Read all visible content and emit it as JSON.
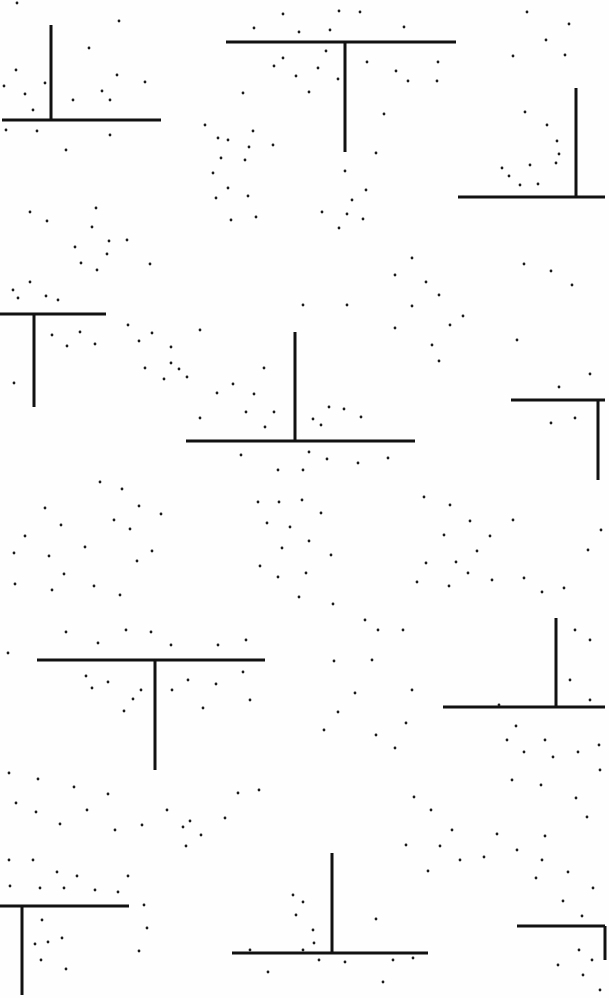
{
  "pattern": {
    "width": 609,
    "height": 998,
    "background": "#fefefe",
    "ink": "#111111",
    "t_shapes": [
      {
        "hx1": 2,
        "hx2": 161,
        "hy": 120,
        "vx": 51,
        "vy1": 25,
        "vy2": 120
      },
      {
        "hx1": 226,
        "hx2": 456,
        "hy": 42,
        "vx": 345,
        "vy1": 42,
        "vy2": 152
      },
      {
        "hx1": 458,
        "hx2": 605,
        "hy": 197,
        "vx": 576,
        "vy1": 88,
        "vy2": 197
      },
      {
        "hx1": 0,
        "hx2": 106,
        "hy": 314,
        "vx": 34,
        "vy1": 314,
        "vy2": 407
      },
      {
        "hx1": 186,
        "hx2": 415,
        "hy": 441,
        "vx": 295,
        "vy1": 332,
        "vy2": 441
      },
      {
        "hx1": 511,
        "hx2": 605,
        "hy": 400,
        "vx": 598,
        "vy1": 400,
        "vy2": 480
      },
      {
        "hx1": 37,
        "hx2": 265,
        "hy": 660,
        "vx": 155,
        "vy1": 660,
        "vy2": 770
      },
      {
        "hx1": 443,
        "hx2": 605,
        "hy": 707,
        "vx": 556,
        "vy1": 618,
        "vy2": 707
      },
      {
        "hx1": 0,
        "hx2": 129,
        "hy": 906,
        "vx": 22,
        "vy1": 906,
        "vy2": 995
      },
      {
        "hx1": 232,
        "hx2": 428,
        "hy": 953,
        "vx": 332,
        "vy1": 853,
        "vy2": 953
      },
      {
        "hx1": 517,
        "hx2": 605,
        "hy": 926,
        "vx": 605,
        "vy1": 926,
        "vy2": 960
      }
    ],
    "dots": [
      [
        17,
        3
      ],
      [
        119,
        21
      ],
      [
        89,
        48
      ],
      [
        16,
        70
      ],
      [
        45,
        83
      ],
      [
        25,
        94
      ],
      [
        102,
        91
      ],
      [
        73,
        100
      ],
      [
        145,
        82
      ],
      [
        117,
        75
      ],
      [
        110,
        100
      ],
      [
        33,
        110
      ],
      [
        6,
        130
      ],
      [
        37,
        131
      ],
      [
        66,
        150
      ],
      [
        110,
        135
      ],
      [
        4,
        86
      ],
      [
        283,
        14
      ],
      [
        339,
        11
      ],
      [
        360,
        12
      ],
      [
        254,
        28
      ],
      [
        299,
        32
      ],
      [
        330,
        30
      ],
      [
        404,
        27
      ],
      [
        326,
        51
      ],
      [
        283,
        58
      ],
      [
        274,
        66
      ],
      [
        296,
        76
      ],
      [
        318,
        68
      ],
      [
        338,
        79
      ],
      [
        367,
        62
      ],
      [
        396,
        71
      ],
      [
        408,
        81
      ],
      [
        438,
        62
      ],
      [
        437,
        81
      ],
      [
        309,
        92
      ],
      [
        384,
        114
      ],
      [
        243,
        93
      ],
      [
        253,
        131
      ],
      [
        218,
        138
      ],
      [
        249,
        147
      ],
      [
        273,
        145
      ],
      [
        376,
        153
      ],
      [
        527,
        12
      ],
      [
        569,
        24
      ],
      [
        546,
        40
      ],
      [
        565,
        55
      ],
      [
        513,
        56
      ],
      [
        525,
        112
      ],
      [
        547,
        125
      ],
      [
        557,
        141
      ],
      [
        556,
        163
      ],
      [
        530,
        165
      ],
      [
        509,
        176
      ],
      [
        502,
        168
      ],
      [
        538,
        184
      ],
      [
        520,
        185
      ],
      [
        559,
        154
      ],
      [
        205,
        125
      ],
      [
        228,
        140
      ],
      [
        221,
        158
      ],
      [
        213,
        173
      ],
      [
        245,
        160
      ],
      [
        228,
        188
      ],
      [
        248,
        196
      ],
      [
        256,
        217
      ],
      [
        216,
        198
      ],
      [
        231,
        220
      ],
      [
        345,
        171
      ],
      [
        366,
        190
      ],
      [
        352,
        200
      ],
      [
        347,
        214
      ],
      [
        363,
        219
      ],
      [
        339,
        228
      ],
      [
        322,
        212
      ],
      [
        30,
        212
      ],
      [
        47,
        221
      ],
      [
        92,
        227
      ],
      [
        96,
        208
      ],
      [
        109,
        241
      ],
      [
        127,
        240
      ],
      [
        107,
        254
      ],
      [
        97,
        270
      ],
      [
        150,
        264
      ],
      [
        81,
        263
      ],
      [
        75,
        247
      ],
      [
        13,
        290
      ],
      [
        46,
        296
      ],
      [
        30,
        282
      ],
      [
        18,
        298
      ],
      [
        52,
        335
      ],
      [
        67,
        346
      ],
      [
        95,
        344
      ],
      [
        14,
        383
      ],
      [
        80,
        332
      ],
      [
        58,
        300
      ],
      [
        128,
        325
      ],
      [
        152,
        333
      ],
      [
        139,
        341
      ],
      [
        171,
        347
      ],
      [
        179,
        369
      ],
      [
        187,
        377
      ],
      [
        164,
        379
      ],
      [
        145,
        368
      ],
      [
        171,
        363
      ],
      [
        200,
        330
      ],
      [
        303,
        305
      ],
      [
        347,
        305
      ],
      [
        264,
        368
      ],
      [
        233,
        384
      ],
      [
        254,
        394
      ],
      [
        217,
        393
      ],
      [
        200,
        418
      ],
      [
        246,
        412
      ],
      [
        274,
        412
      ],
      [
        329,
        407
      ],
      [
        313,
        419
      ],
      [
        344,
        409
      ],
      [
        361,
        417
      ],
      [
        321,
        425
      ],
      [
        265,
        427
      ],
      [
        241,
        455
      ],
      [
        278,
        470
      ],
      [
        303,
        470
      ],
      [
        327,
        459
      ],
      [
        358,
        463
      ],
      [
        388,
        458
      ],
      [
        309,
        452
      ],
      [
        412,
        258
      ],
      [
        395,
        275
      ],
      [
        426,
        282
      ],
      [
        439,
        295
      ],
      [
        412,
        306
      ],
      [
        395,
        328
      ],
      [
        432,
        345
      ],
      [
        450,
        325
      ],
      [
        463,
        316
      ],
      [
        439,
        361
      ],
      [
        551,
        271
      ],
      [
        572,
        285
      ],
      [
        524,
        264
      ],
      [
        590,
        374
      ],
      [
        559,
        387
      ],
      [
        575,
        418
      ],
      [
        551,
        423
      ],
      [
        517,
        340
      ],
      [
        100,
        482
      ],
      [
        122,
        489
      ],
      [
        139,
        506
      ],
      [
        114,
        520
      ],
      [
        161,
        514
      ],
      [
        130,
        529
      ],
      [
        152,
        551
      ],
      [
        137,
        561
      ],
      [
        45,
        508
      ],
      [
        61,
        525
      ],
      [
        25,
        536
      ],
      [
        49,
        556
      ],
      [
        85,
        547
      ],
      [
        14,
        553
      ],
      [
        15,
        584
      ],
      [
        52,
        590
      ],
      [
        64,
        574
      ],
      [
        94,
        586
      ],
      [
        120,
        595
      ],
      [
        258,
        502
      ],
      [
        279,
        502
      ],
      [
        302,
        500
      ],
      [
        267,
        523
      ],
      [
        290,
        527
      ],
      [
        321,
        513
      ],
      [
        309,
        541
      ],
      [
        282,
        548
      ],
      [
        331,
        555
      ],
      [
        306,
        573
      ],
      [
        278,
        577
      ],
      [
        299,
        597
      ],
      [
        260,
        566
      ],
      [
        424,
        497
      ],
      [
        450,
        505
      ],
      [
        470,
        521
      ],
      [
        490,
        536
      ],
      [
        477,
        551
      ],
      [
        456,
        562
      ],
      [
        426,
        563
      ],
      [
        444,
        535
      ],
      [
        468,
        573
      ],
      [
        492,
        580
      ],
      [
        449,
        586
      ],
      [
        417,
        582
      ],
      [
        524,
        578
      ],
      [
        542,
        592
      ],
      [
        564,
        588
      ],
      [
        588,
        550
      ],
      [
        601,
        530
      ],
      [
        513,
        520
      ],
      [
        66,
        632
      ],
      [
        98,
        643
      ],
      [
        126,
        630
      ],
      [
        151,
        632
      ],
      [
        171,
        645
      ],
      [
        218,
        645
      ],
      [
        246,
        640
      ],
      [
        243,
        672
      ],
      [
        216,
        684
      ],
      [
        203,
        708
      ],
      [
        250,
        700
      ],
      [
        188,
        680
      ],
      [
        172,
        690
      ],
      [
        86,
        676
      ],
      [
        92,
        688
      ],
      [
        108,
        682
      ],
      [
        124,
        711
      ],
      [
        133,
        699
      ],
      [
        141,
        690
      ],
      [
        8,
        653
      ],
      [
        333,
        604
      ],
      [
        365,
        620
      ],
      [
        378,
        630
      ],
      [
        403,
        630
      ],
      [
        372,
        660
      ],
      [
        334,
        661
      ],
      [
        355,
        693
      ],
      [
        338,
        712
      ],
      [
        324,
        730
      ],
      [
        376,
        735
      ],
      [
        406,
        723
      ],
      [
        395,
        748
      ],
      [
        412,
        690
      ],
      [
        575,
        630
      ],
      [
        590,
        640
      ],
      [
        570,
        680
      ],
      [
        590,
        700
      ],
      [
        499,
        705
      ],
      [
        507,
        740
      ],
      [
        524,
        752
      ],
      [
        545,
        740
      ],
      [
        553,
        757
      ],
      [
        578,
        752
      ],
      [
        599,
        745
      ],
      [
        516,
        726
      ],
      [
        9,
        773
      ],
      [
        38,
        779
      ],
      [
        36,
        812
      ],
      [
        16,
        803
      ],
      [
        108,
        794
      ],
      [
        74,
        787
      ],
      [
        87,
        810
      ],
      [
        60,
        824
      ],
      [
        115,
        830
      ],
      [
        142,
        825
      ],
      [
        167,
        810
      ],
      [
        190,
        821
      ],
      [
        238,
        793
      ],
      [
        259,
        790
      ],
      [
        225,
        818
      ],
      [
        201,
        835
      ],
      [
        183,
        827
      ],
      [
        186,
        846
      ],
      [
        414,
        797
      ],
      [
        431,
        810
      ],
      [
        452,
        830
      ],
      [
        440,
        846
      ],
      [
        460,
        860
      ],
      [
        428,
        871
      ],
      [
        406,
        845
      ],
      [
        484,
        857
      ],
      [
        517,
        850
      ],
      [
        542,
        860
      ],
      [
        568,
        872
      ],
      [
        593,
        888
      ],
      [
        497,
        834
      ],
      [
        545,
        836
      ],
      [
        587,
        817
      ],
      [
        512,
        780
      ],
      [
        541,
        785
      ],
      [
        576,
        798
      ],
      [
        600,
        770
      ],
      [
        9,
        860
      ],
      [
        33,
        860
      ],
      [
        57,
        872
      ],
      [
        77,
        876
      ],
      [
        10,
        886
      ],
      [
        40,
        888
      ],
      [
        64,
        888
      ],
      [
        95,
        890
      ],
      [
        118,
        892
      ],
      [
        128,
        876
      ],
      [
        144,
        905
      ],
      [
        147,
        928
      ],
      [
        42,
        920
      ],
      [
        48,
        942
      ],
      [
        35,
        944
      ],
      [
        62,
        938
      ],
      [
        41,
        960
      ],
      [
        139,
        951
      ],
      [
        66,
        969
      ],
      [
        303,
        902
      ],
      [
        296,
        915
      ],
      [
        313,
        930
      ],
      [
        314,
        943
      ],
      [
        303,
        950
      ],
      [
        319,
        960
      ],
      [
        345,
        962
      ],
      [
        393,
        960
      ],
      [
        413,
        958
      ],
      [
        383,
        982
      ],
      [
        268,
        972
      ],
      [
        250,
        950
      ],
      [
        376,
        919
      ],
      [
        293,
        895
      ],
      [
        536,
        878
      ],
      [
        563,
        901
      ],
      [
        582,
        916
      ],
      [
        579,
        950
      ],
      [
        592,
        960
      ],
      [
        583,
        975
      ],
      [
        558,
        965
      ],
      [
        600,
        990
      ]
    ]
  }
}
